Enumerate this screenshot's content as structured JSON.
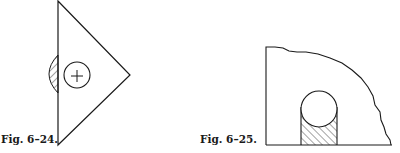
{
  "figures": [
    {
      "id": "fig-6-24",
      "caption": "Fig. 6–24.",
      "shapes": [
        "triangle",
        "circle-with-cross",
        "hatched-half-lens"
      ]
    },
    {
      "id": "fig-6-25",
      "caption": "Fig. 6–25.",
      "shapes": [
        "irregular-quarter-region",
        "circle",
        "hatched-slot"
      ]
    }
  ],
  "colors": {
    "stroke": "#1a1a1a",
    "background": "#ffffff"
  }
}
